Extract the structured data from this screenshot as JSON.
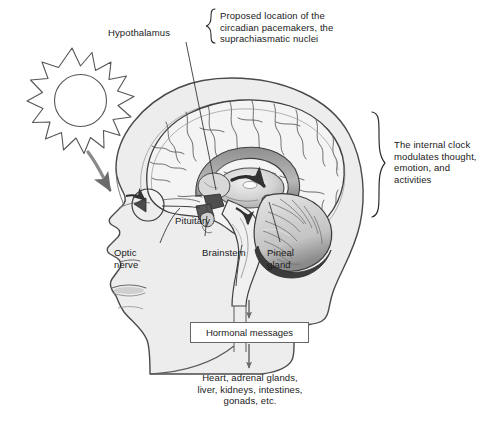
{
  "figure": {
    "background_color": "#ffffff",
    "head_fill_color": "#ededed",
    "line_color": "#4a4a4a",
    "text_color": "#1a1a1a"
  },
  "labels": {
    "hypothalamus": "Hypothalamus",
    "hypothalamus_note": "Proposed location of the\ncircadian pacemakers, the\nsuprachiasmatic nuclei",
    "internal_clock_note": "The internal clock\nmodulates thought,\nemotion, and\nactivities",
    "pituitary": "Pituitary",
    "optic_nerve": "Optic\nnerve",
    "brainstem": "Brainstem",
    "pineal_gland": "Pineal\ngland",
    "hormonal_messages": "Hormonal messages",
    "target_organs": "Heart, adrenal glands,\nliver, kidneys, intestines,\ngonads, etc."
  },
  "icons": {
    "sun": "sun-icon",
    "light_arrow": "curved-arrow-icon",
    "brace_top": "curly-brace-icon",
    "brace_right": "curly-brace-icon",
    "arrow_down_to_box": "down-arrow-icon",
    "arrow_down_from_box": "down-arrow-icon"
  }
}
